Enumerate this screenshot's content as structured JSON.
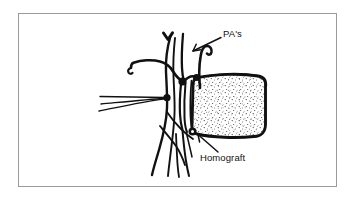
{
  "figure": {
    "kind": "line-drawing",
    "frame": {
      "border_color": "#9a9a9d",
      "background_color": "#ffffff"
    },
    "ink_color": "#111111",
    "stipple_color": "#2a2a2a"
  },
  "labels": {
    "pa": {
      "text": "PA's",
      "leader": "arrow-pointing-down-left"
    },
    "homograft": {
      "text": "Homograft",
      "leader": "arrow-pointing-up-left"
    }
  },
  "marks": {
    "chevron": {
      "name": "chevron-down-mark"
    }
  },
  "parts": {
    "conduit": "homograft-conduit",
    "pulmonary_arteries": "pulmonary-artery-branches",
    "sutures": "suture-lines",
    "knots": "suture-knots"
  }
}
